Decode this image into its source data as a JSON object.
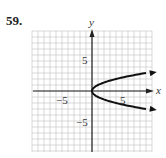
{
  "problem_number": "59.",
  "chart_data": {
    "type": "line",
    "title": "",
    "xlabel": "x",
    "ylabel": "y",
    "xlim": [
      -10,
      10
    ],
    "ylim": [
      -10,
      10
    ],
    "grid": true,
    "tick_labels": {
      "x": [
        "-5",
        "5"
      ],
      "y": [
        "5",
        "-5"
      ]
    },
    "series": [
      {
        "name": "x = y^2",
        "points": [
          [
            9.8,
            -3.13
          ],
          [
            9,
            -3
          ],
          [
            4,
            -2
          ],
          [
            1,
            -1
          ],
          [
            0.25,
            -0.5
          ],
          [
            0,
            0
          ],
          [
            0.25,
            0.5
          ],
          [
            1,
            1
          ],
          [
            4,
            2
          ],
          [
            9,
            3
          ],
          [
            9.8,
            3.13
          ]
        ],
        "arrows": "both ends"
      }
    ]
  },
  "labels": {
    "x_axis": "x",
    "y_axis": "y",
    "x_neg5": "−5",
    "x_pos5": "5",
    "y_pos5": "5",
    "y_neg5": "−5"
  }
}
